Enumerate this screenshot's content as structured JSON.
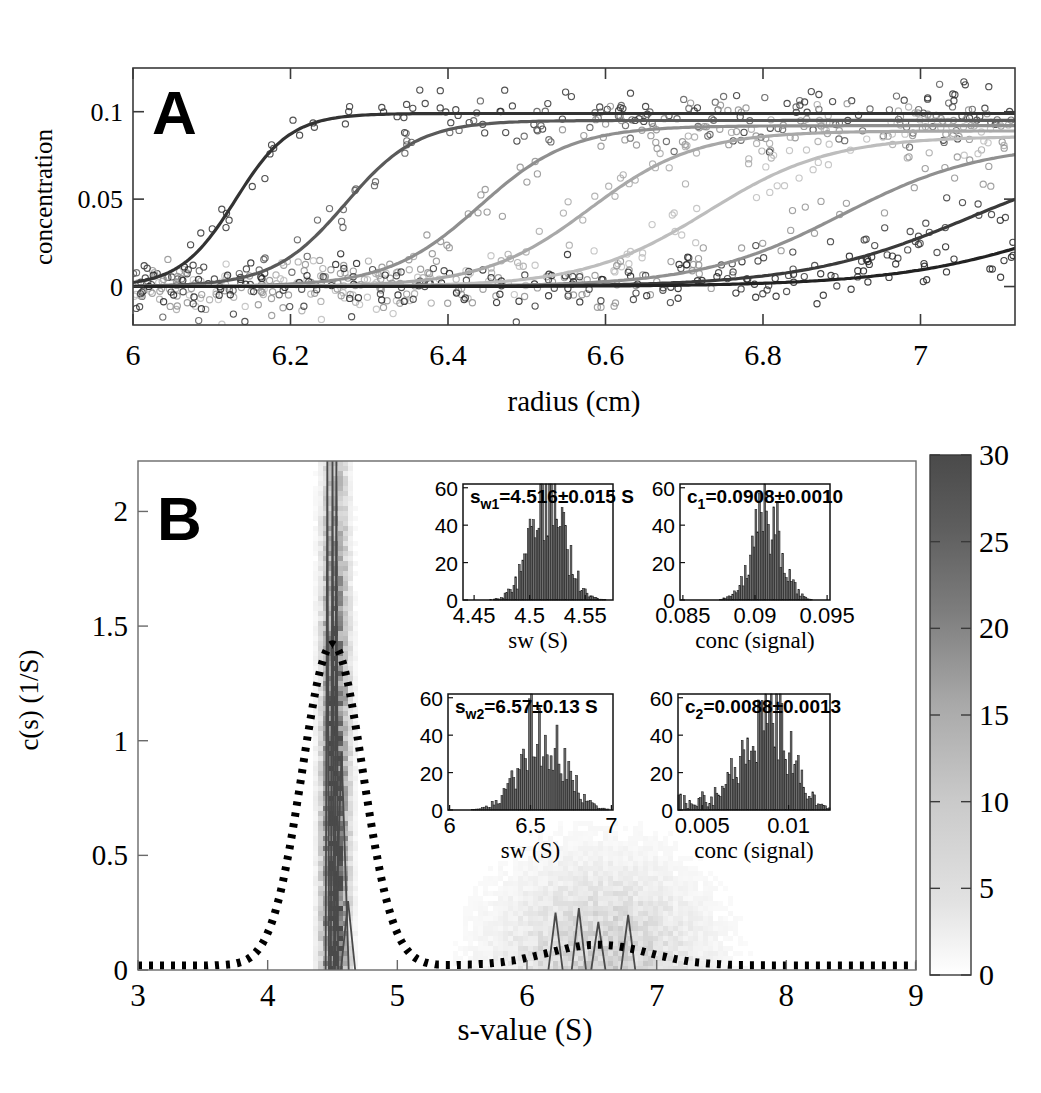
{
  "figure": {
    "panels": [
      "A",
      "B"
    ]
  },
  "panelA": {
    "letter": "A",
    "ylabel": "concentration",
    "xlabel": "radius (cm)",
    "yticks": [
      "0",
      "0.05",
      "0.1"
    ],
    "ytickvals": [
      0,
      0.05,
      0.1
    ],
    "xticks": [
      "6",
      "6.2",
      "6.4",
      "6.6",
      "6.8",
      "7"
    ],
    "xtickvals": [
      6,
      6.2,
      6.4,
      6.6,
      6.8,
      7
    ]
  },
  "panelB": {
    "letter": "B",
    "ylabel": "c(s) (1/S)",
    "xlabel": "s-value (S)",
    "yticks": [
      "0",
      "0.5",
      "1",
      "1.5",
      "2"
    ],
    "ytickvals": [
      0,
      0.5,
      1,
      1.5,
      2
    ],
    "xticks": [
      "3",
      "4",
      "5",
      "6",
      "7",
      "8",
      "9"
    ],
    "xtickvals": [
      3,
      4,
      5,
      6,
      7,
      8,
      9
    ]
  },
  "colorbar": {
    "ticks": [
      "0",
      "5",
      "10",
      "15",
      "20",
      "25",
      "30"
    ],
    "tickvals": [
      0,
      5,
      10,
      15,
      20,
      25,
      30
    ],
    "min_color": "#ffffff",
    "max_color": "#4a4a4a"
  },
  "insets": [
    {
      "id": "sw1",
      "annotation": "s_w1_=4.516±0.015 S",
      "label_main": "s",
      "label_sub": "w1",
      "label_rest": "=4.516±0.015 S",
      "xlabel": "sw (S)",
      "yticks": [
        "0",
        "20",
        "40",
        "60"
      ],
      "ytickvals": [
        0,
        20,
        40,
        60
      ],
      "xticks": [
        "4.45",
        "4.5",
        "4.55"
      ],
      "xtickvals": [
        4.45,
        4.5,
        4.55
      ],
      "xlim": [
        4.44,
        4.575
      ],
      "ylim": [
        0,
        62
      ],
      "center": 4.516,
      "sigma": 0.0155,
      "peak": 52
    },
    {
      "id": "c1",
      "annotation": "c_1_=0.0908±0.0010",
      "label_main": "c",
      "label_sub": "1",
      "label_rest": "=0.0908±0.0010",
      "xlabel": "conc (signal)",
      "yticks": [
        "0",
        "20",
        "40",
        "60"
      ],
      "ytickvals": [
        0,
        20,
        40,
        60
      ],
      "xticks": [
        "0.085",
        "0.09",
        "0.095"
      ],
      "xtickvals": [
        0.085,
        0.09,
        0.095
      ],
      "xlim": [
        0.0848,
        0.0952
      ],
      "ylim": [
        0,
        62
      ],
      "center": 0.0908,
      "sigma": 0.00104,
      "peak": 44
    },
    {
      "id": "sw2",
      "annotation": "s_w2_=6.57±0.13 S",
      "label_main": "s",
      "label_sub": "w2",
      "label_rest": "=6.57±0.13 S",
      "xlabel": "sw (S)",
      "yticks": [
        "0",
        "20",
        "40",
        "60"
      ],
      "ytickvals": [
        0,
        20,
        40,
        60
      ],
      "xticks": [
        "6",
        "6.5",
        "7"
      ],
      "xtickvals": [
        6,
        6.5,
        7
      ],
      "xlim": [
        5.99,
        7.01
      ],
      "ylim": [
        0,
        62
      ],
      "center": 6.57,
      "sigma": 0.132,
      "peak": 46
    },
    {
      "id": "c2",
      "annotation": "c_2_=0.0088±0.0013",
      "label_main": "c",
      "label_sub": "2",
      "label_rest": "=0.0088±0.0013",
      "xlabel": "conc (signal)",
      "yticks": [
        "0",
        "20",
        "40",
        "60"
      ],
      "ytickvals": [
        0,
        20,
        40,
        60
      ],
      "xticks": [
        "0.005",
        "0.01"
      ],
      "xtickvals": [
        0.005,
        0.01
      ],
      "xlim": [
        0.0036,
        0.0124
      ],
      "ylim": [
        0,
        62
      ],
      "center": 0.0088,
      "sigma": 0.00128,
      "peak": 52
    }
  ],
  "chart_data": [
    {
      "type": "line",
      "title": "A",
      "xlabel": "radius (cm)",
      "ylabel": "concentration",
      "xlim": [
        6.0,
        7.12
      ],
      "ylim": [
        -0.022,
        0.125
      ],
      "description": "Sedimentation velocity boundary scans: 7 sigmoidal boundary curves with noisy scatter data",
      "series": [
        {
          "name": "scan-1",
          "midpoint": 6.13,
          "width": 0.035,
          "plateau": 0.099,
          "gray": "#333333"
        },
        {
          "name": "scan-2",
          "midpoint": 6.27,
          "width": 0.046,
          "plateau": 0.095,
          "gray": "#5a5a5a"
        },
        {
          "name": "scan-3",
          "midpoint": 6.44,
          "width": 0.058,
          "plateau": 0.092,
          "gray": "#8f8f8f"
        },
        {
          "name": "scan-4",
          "midpoint": 6.58,
          "width": 0.067,
          "plateau": 0.089,
          "gray": "#a8a8a8"
        },
        {
          "name": "scan-5",
          "midpoint": 6.73,
          "width": 0.078,
          "plateau": 0.086,
          "gray": "#bdbdbd"
        },
        {
          "name": "scan-6",
          "midpoint": 6.9,
          "width": 0.09,
          "plateau": 0.082,
          "gray": "#909090"
        },
        {
          "name": "scan-7",
          "midpoint": 7.06,
          "width": 0.105,
          "plateau": 0.078,
          "gray": "#3a3a3a"
        },
        {
          "name": "scan-8",
          "midpoint": 7.22,
          "width": 0.115,
          "plateau": 0.074,
          "gray": "#222222"
        }
      ],
      "noise_sd": 0.013,
      "n_points_per_scan": 110
    },
    {
      "type": "line",
      "title": "B",
      "xlabel": "s-value (S)",
      "ylabel": "c(s) (1/S)",
      "xlim": [
        3.0,
        9.0
      ],
      "ylim": [
        0,
        2.22
      ],
      "description": "c(s) distribution: bootstrap density map (grayscale) overlaid with dotted best-fit distribution and sharp solid c(s) traces",
      "dotted_curve": {
        "name": "mean c(s) distribution",
        "peak1_center": 4.5,
        "peak1_height": 1.4,
        "peak1_width": 0.33,
        "peak2_center": 6.55,
        "peak2_height": 0.09,
        "peak2_width": 0.55,
        "baseline": 0.02
      },
      "sharp_peaks": [
        {
          "s": 4.46,
          "height": 2.22
        },
        {
          "s": 4.5,
          "height": 2.22
        },
        {
          "s": 4.53,
          "height": 2.22
        },
        {
          "s": 4.57,
          "height": 0.95
        },
        {
          "s": 4.62,
          "height": 0.3
        },
        {
          "s": 6.22,
          "height": 0.25
        },
        {
          "s": 6.4,
          "height": 0.27
        },
        {
          "s": 6.55,
          "height": 0.21
        },
        {
          "s": 6.78,
          "height": 0.24
        }
      ],
      "density_bands": [
        {
          "s_center": 4.5,
          "s_width": 0.09,
          "max_value": 30
        },
        {
          "s_center": 6.55,
          "s_width": 0.7,
          "max_value": 8
        }
      ]
    }
  ]
}
